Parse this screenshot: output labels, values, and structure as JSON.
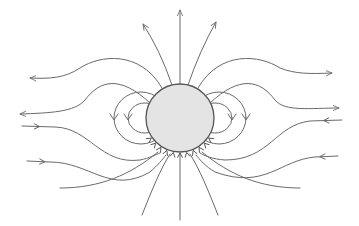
{
  "diagram": {
    "colors": {
      "background": "#ffffff",
      "line": "#6a6a6a",
      "sphere_fill": "#e4e4e4",
      "sphere_stroke": "#555555"
    },
    "sphere": {
      "cx": 180,
      "cy": 118,
      "r": 34
    },
    "field_lines": [
      {
        "id": "top-center",
        "d": "M180 84 L180 10",
        "arrow_end": true
      },
      {
        "id": "top-left",
        "d": "M172 85 Q160 50 143 24",
        "arrow_end": true
      },
      {
        "id": "top-right",
        "d": "M188 85 Q200 50 216 22",
        "arrow_end": true
      },
      {
        "id": "upper-left-out",
        "d": "M162 88 C140 50 100 55 80 68 C65 78 50 79 30 78",
        "arrow_end": true
      },
      {
        "id": "upper-right-out",
        "d": "M198 88 C220 50 260 55 280 68 C295 74 310 74 332 73",
        "arrow_end": true
      },
      {
        "id": "mid-left-out",
        "d": "M150 103 C120 75 100 80 85 100 C75 112 50 113 20 114",
        "arrow_end": true
      },
      {
        "id": "mid-right-out",
        "d": "M210 103 C240 75 260 80 275 100 C285 112 310 108 339 108",
        "arrow_end": true
      },
      {
        "id": "lower-left-in",
        "d": "M22 126 L55 127 C90 128 100 165 140 160 C150 158 155 155 160 153",
        "arrow_mid": true
      },
      {
        "id": "lower-right-in",
        "d": "M342 120 L310 121 C275 125 270 160 225 160 C212 159 205 156 200 153",
        "arrow_mid": true
      },
      {
        "id": "bottom-left-in",
        "d": "M27 161 L50 162 C90 162 110 195 150 172 C158 165 162 160 166 155",
        "arrow_mid": true
      },
      {
        "id": "bottom-right-in",
        "d": "M338 156 L315 157 C280 160 265 190 215 172 C205 166 200 160 196 155",
        "arrow_mid": true
      },
      {
        "id": "bottom-far-left",
        "d": "M142 215 C152 190 160 170 170 154"
      },
      {
        "id": "bottom-center",
        "d": "M180 220 L180 153"
      },
      {
        "id": "bottom-far-right",
        "d": "M218 215 C208 190 200 170 190 154"
      },
      {
        "id": "lower-mid-left",
        "d": "M60 188 C100 188 130 175 158 152"
      },
      {
        "id": "lower-mid-right",
        "d": "M300 188 C260 188 230 175 202 152"
      }
    ],
    "loops": [
      {
        "id": "left-outer-loop",
        "cx": 141,
        "cy": 118,
        "rx": 27,
        "ry": 26
      },
      {
        "id": "left-inner-loop",
        "cx": 145,
        "cy": 118,
        "rx": 17,
        "ry": 15
      },
      {
        "id": "right-outer-loop",
        "cx": 219,
        "cy": 118,
        "rx": 27,
        "ry": 26
      },
      {
        "id": "right-inner-loop",
        "cx": 215,
        "cy": 118,
        "rx": 17,
        "ry": 15
      }
    ]
  }
}
